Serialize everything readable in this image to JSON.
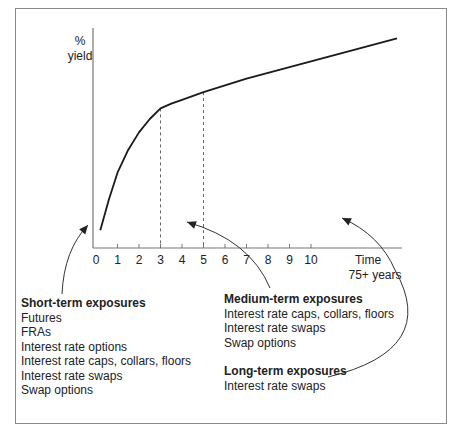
{
  "chart_data": {
    "type": "line",
    "title": "",
    "ylabel_line1": "%",
    "ylabel_line2": "yield",
    "xlabel_line1": "Time",
    "xlabel_line2": "75+ years",
    "x_ticks": [
      "0",
      "1",
      "2",
      "3",
      "4",
      "5",
      "6",
      "7",
      "8",
      "9",
      "10"
    ],
    "xlim": [
      0,
      14
    ],
    "ylim": [
      0,
      10
    ],
    "grid": false,
    "series": [
      {
        "name": "yield curve",
        "x": [
          0.2,
          0.6,
          1.0,
          1.5,
          2.0,
          2.5,
          3.0,
          3.5,
          4.0,
          5.0,
          6.0,
          7.0,
          8.0,
          9.0,
          10.0,
          11.0,
          12.0,
          13.0,
          14.0
        ],
        "y": [
          0.4,
          2.0,
          3.4,
          4.6,
          5.5,
          6.2,
          6.75,
          7.0,
          7.2,
          7.6,
          7.95,
          8.3,
          8.6,
          8.9,
          9.2,
          9.5,
          9.8,
          10.1,
          10.4
        ]
      }
    ],
    "dashed_markers": [
      3,
      5
    ],
    "annotations": [
      {
        "text": "Short-term exposures",
        "points_to_x": 1.8
      },
      {
        "text": "Medium-term exposures",
        "points_to_x": 4.2
      },
      {
        "text": "Long-term exposures",
        "points_to_x": 10.2
      }
    ]
  },
  "groups": {
    "short": {
      "title": "Short-term exposures",
      "items": [
        "Futures",
        "FRAs",
        "Interest rate options",
        "Interest rate caps, collars, floors",
        "Interest rate swaps",
        "Swap options"
      ]
    },
    "medium": {
      "title": "Medium-term exposures",
      "items": [
        "Interest rate caps, collars, floors",
        "Interest rate swaps",
        "Swap options"
      ]
    },
    "long": {
      "title": "Long-term exposures",
      "items": [
        "Interest rate swaps"
      ]
    }
  }
}
